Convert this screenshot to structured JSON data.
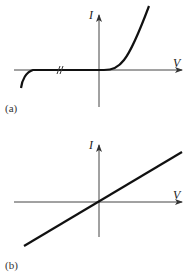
{
  "panels": [
    {
      "id": "a",
      "caption": "(a)",
      "y_axis_label": "I",
      "x_axis_label": "V",
      "description": "Nonlinear I-V curve: near-zero current for negative voltage with breakdown at far left (axis break), exponential rise for positive voltage"
    },
    {
      "id": "b",
      "caption": "(b)",
      "y_axis_label": "I",
      "x_axis_label": "V",
      "description": "Linear I-V curve through origin (ohmic)"
    }
  ],
  "colors": {
    "axis": "#444444",
    "curve": "#111111",
    "background": "#ffffff"
  }
}
